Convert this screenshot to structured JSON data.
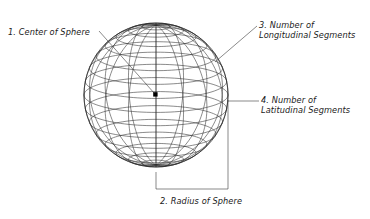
{
  "diagram": {
    "background_color": "#ffffff",
    "line_color": "#2b2b2b",
    "text_color": "#1a1a1a",
    "sphere": {
      "name": "wireframe-sphere",
      "center_x": 156,
      "center_y": 95,
      "radius": 72,
      "longitudinal_segments": 16,
      "latitudinal_segments": 16,
      "center_marker": "filled-square"
    },
    "annotations": [
      {
        "number": "1.",
        "line1": "1. Center of Sphere",
        "line2": "",
        "points_to": "center-point"
      },
      {
        "number": "2.",
        "line1": "2. Radius of Sphere",
        "line2": "",
        "points_to": "radius-bracket"
      },
      {
        "number": "3.",
        "line1": "3. Number of",
        "line2": "Longitudinal Segments",
        "points_to": "longitude-lines"
      },
      {
        "number": "4.",
        "line1": "4. Number of",
        "line2": "Latitudinal Segments",
        "points_to": "latitude-lines"
      }
    ]
  }
}
